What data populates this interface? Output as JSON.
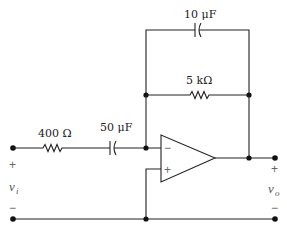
{
  "circuit": {
    "type": "inverting op-amp integrator/filter circuit",
    "components": {
      "input_resistor": {
        "label": "400 Ω"
      },
      "input_capacitor": {
        "label": "50 μF"
      },
      "feedback_capacitor": {
        "label": "10 μF"
      },
      "feedback_resistor": {
        "label": "5 kΩ"
      }
    },
    "opamp": {
      "inverting_sign": "−",
      "noninverting_sign": "+"
    },
    "input": {
      "label": "v",
      "subscript": "i",
      "plus": "+",
      "minus": "−"
    },
    "output": {
      "label": "v",
      "subscript": "o",
      "plus": "+",
      "minus": "−"
    }
  }
}
